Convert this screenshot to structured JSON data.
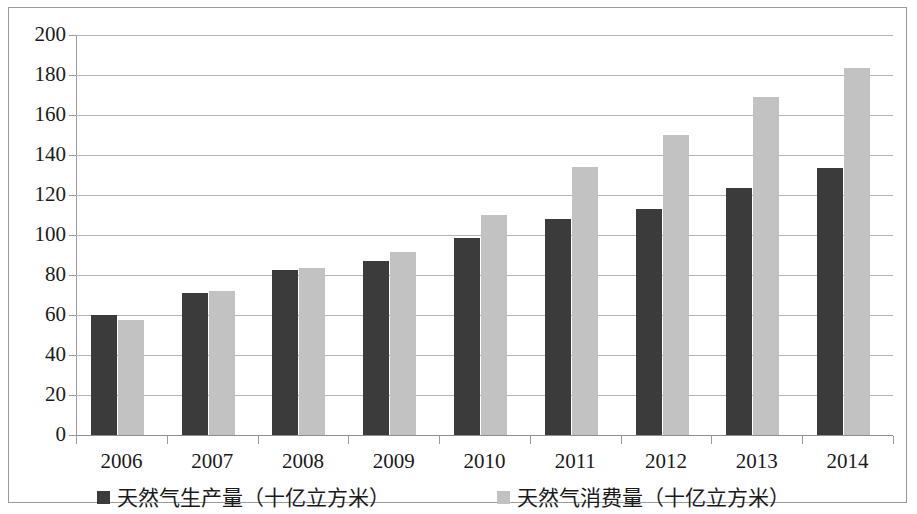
{
  "chart_data": {
    "type": "bar",
    "title": "",
    "subtitle": "",
    "xlabel": "",
    "ylabel": "",
    "categories": [
      "2006",
      "2007",
      "2008",
      "2009",
      "2010",
      "2011",
      "2012",
      "2013",
      "2014"
    ],
    "series": [
      {
        "name": "天然气生产量（十亿立方米）",
        "color": "#3b3b3b",
        "values": [
          60.0,
          71.0,
          82.5,
          87.0,
          98.5,
          108.0,
          113.0,
          123.5,
          133.5
        ]
      },
      {
        "name": "天然气消费量（十亿立方米）",
        "color": "#c2c2c2",
        "values": [
          57.5,
          72.0,
          83.5,
          91.5,
          110.0,
          134.0,
          150.0,
          169.0,
          183.5
        ]
      }
    ],
    "ylim": [
      0,
      200
    ],
    "ytick_step": 20,
    "yticks": [
      "200",
      "180",
      "160",
      "140",
      "120",
      "100",
      "80",
      "60",
      "40",
      "20",
      "0"
    ],
    "grid": true,
    "legend_position": "bottom"
  },
  "legend": {
    "entries": [
      {
        "label": "天然气生产量（十亿立方米）",
        "swatch": "#3b3b3b"
      },
      {
        "label": "天然气消费量（十亿立方米）",
        "swatch": "#c2c2c2"
      }
    ]
  },
  "axes": {
    "y_axis_name": "y-axis",
    "x_axis_name": "x-axis"
  }
}
